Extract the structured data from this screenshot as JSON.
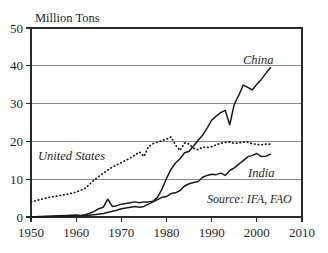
{
  "chart_data": {
    "type": "line",
    "title": "",
    "subtitle": "",
    "xlabel": "",
    "ylabel": "Million Tons",
    "ylabel_position": "above-axis-top-left",
    "xlim": [
      1950,
      2010
    ],
    "ylim": [
      0,
      50
    ],
    "xticks": [
      "1950",
      "1960",
      "1970",
      "1980",
      "1990",
      "2000",
      "2010"
    ],
    "yticks": [
      "0",
      "10",
      "20",
      "30",
      "40",
      "50"
    ],
    "grid": "horizontal",
    "legend_position": "inline-annotations",
    "annotations": [
      {
        "name": "source",
        "text": "Source: IFA, FAO"
      }
    ],
    "series": [
      {
        "name": "China",
        "label": "China",
        "style": "solid",
        "color": "#1a1a1a",
        "x": [
          1950,
          1952,
          1954,
          1956,
          1958,
          1960,
          1961,
          1962,
          1963,
          1964,
          1965,
          1966,
          1967,
          1968,
          1969,
          1970,
          1971,
          1972,
          1973,
          1974,
          1975,
          1976,
          1977,
          1978,
          1979,
          1980,
          1981,
          1982,
          1983,
          1984,
          1985,
          1986,
          1987,
          1988,
          1989,
          1990,
          1991,
          1992,
          1993,
          1994,
          1995,
          1996,
          1997,
          1998,
          1999,
          2000,
          2001,
          2002,
          2003
        ],
        "values": [
          0.0,
          0.1,
          0.2,
          0.3,
          0.4,
          0.5,
          0.4,
          0.6,
          1.0,
          1.5,
          2.2,
          2.6,
          4.7,
          2.8,
          3.0,
          3.4,
          3.6,
          3.8,
          4.0,
          3.8,
          4.0,
          4.0,
          4.2,
          5.2,
          7.4,
          10.2,
          12.6,
          14.3,
          15.4,
          17.0,
          17.4,
          18.8,
          20.3,
          21.6,
          23.5,
          25.6,
          26.7,
          27.6,
          28.2,
          24.4,
          29.8,
          32.2,
          34.9,
          34.3,
          33.6,
          35.1,
          36.4,
          38.0,
          39.5
        ]
      },
      {
        "name": "United States",
        "label": "United States",
        "style": "dotted",
        "color": "#1a1a1a",
        "x": [
          1950,
          1952,
          1954,
          1956,
          1958,
          1960,
          1962,
          1964,
          1966,
          1968,
          1970,
          1972,
          1974,
          1975,
          1976,
          1977,
          1978,
          1979,
          1980,
          1981,
          1982,
          1983,
          1984,
          1985,
          1986,
          1987,
          1988,
          1989,
          1990,
          1991,
          1992,
          1993,
          1994,
          1995,
          1996,
          1997,
          1998,
          1999,
          2000,
          2001,
          2002,
          2003
        ],
        "values": [
          4.0,
          4.6,
          5.2,
          5.6,
          6.0,
          6.6,
          7.6,
          9.8,
          11.6,
          13.2,
          14.4,
          15.6,
          17.2,
          16.0,
          18.6,
          19.4,
          19.8,
          20.2,
          20.6,
          21.2,
          19.0,
          17.6,
          19.6,
          19.3,
          18.2,
          17.8,
          18.5,
          18.4,
          18.6,
          19.1,
          19.5,
          19.7,
          19.8,
          19.5,
          19.6,
          19.8,
          19.8,
          19.4,
          19.2,
          19.1,
          19.3,
          19.3
        ]
      },
      {
        "name": "India",
        "label": "India",
        "style": "solid",
        "color": "#1a1a1a",
        "x": [
          1950,
          1952,
          1954,
          1956,
          1958,
          1960,
          1962,
          1964,
          1966,
          1968,
          1969,
          1970,
          1971,
          1972,
          1973,
          1974,
          1975,
          1976,
          1977,
          1978,
          1979,
          1980,
          1981,
          1982,
          1983,
          1984,
          1985,
          1986,
          1987,
          1988,
          1989,
          1990,
          1991,
          1992,
          1993,
          1994,
          1995,
          1996,
          1997,
          1998,
          1999,
          2000,
          2001,
          2002,
          2003
        ],
        "values": [
          0.0,
          0.05,
          0.1,
          0.15,
          0.2,
          0.3,
          0.4,
          0.6,
          0.9,
          1.5,
          1.8,
          2.2,
          2.4,
          2.6,
          2.8,
          2.6,
          2.8,
          3.4,
          4.0,
          4.6,
          5.2,
          5.4,
          6.2,
          6.4,
          7.0,
          8.2,
          8.8,
          9.1,
          9.4,
          10.5,
          11.0,
          11.3,
          11.2,
          11.6,
          11.0,
          12.3,
          13.0,
          14.0,
          14.9,
          15.9,
          16.3,
          16.8,
          16.0,
          16.1,
          16.6
        ]
      }
    ]
  },
  "labels": {
    "y_axis_title": "Million Tons",
    "china": "China",
    "united_states": "United States",
    "india": "India",
    "source": "Source: IFA, FAO"
  }
}
